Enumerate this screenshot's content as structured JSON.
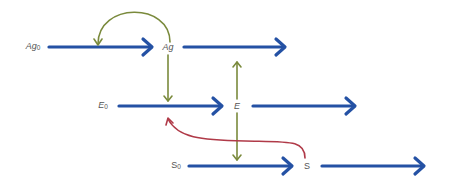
{
  "diagram": {
    "type": "reaction-flow",
    "nodes": [
      {
        "id": "Ag0",
        "base": "Ag",
        "sub": "0",
        "x": 33,
        "y": 47,
        "italic": true
      },
      {
        "id": "Ag",
        "base": "Ag",
        "sub": "",
        "x": 168,
        "y": 47,
        "italic": true
      },
      {
        "id": "E0",
        "base": "E",
        "sub": "0",
        "x": 103,
        "y": 106,
        "italic": true
      },
      {
        "id": "E",
        "base": "E",
        "sub": "",
        "x": 237,
        "y": 106,
        "italic": true
      },
      {
        "id": "S0",
        "base": "S",
        "sub": "0",
        "x": 175,
        "y": 166,
        "italic": false
      },
      {
        "id": "S",
        "base": "S",
        "sub": "",
        "x": 307,
        "y": 166,
        "italic": false
      }
    ],
    "edges": [
      {
        "from": "Ag0",
        "to": "Ag",
        "color": "blue",
        "kind": "flow"
      },
      {
        "from": "Ag",
        "to": "out",
        "color": "blue",
        "kind": "flow"
      },
      {
        "from": "E0",
        "to": "E",
        "color": "blue",
        "kind": "flow"
      },
      {
        "from": "E",
        "to": "out",
        "color": "blue",
        "kind": "flow"
      },
      {
        "from": "S0",
        "to": "S",
        "color": "blue",
        "kind": "flow"
      },
      {
        "from": "S",
        "to": "out",
        "color": "blue",
        "kind": "flow"
      },
      {
        "from": "Ag",
        "to": "Ag0->Ag",
        "color": "green",
        "kind": "influence"
      },
      {
        "from": "Ag",
        "to": "E0->E",
        "color": "green",
        "kind": "influence"
      },
      {
        "from": "E",
        "to": "Ag->out",
        "color": "green",
        "kind": "influence"
      },
      {
        "from": "E",
        "to": "S0->S",
        "color": "green",
        "kind": "influence"
      },
      {
        "from": "S",
        "to": "E0->E",
        "color": "red",
        "kind": "influence"
      }
    ],
    "colors": {
      "blue": "#2451a4",
      "green": "#7a8a3c",
      "red": "#b03a48",
      "label": "#555555"
    }
  }
}
